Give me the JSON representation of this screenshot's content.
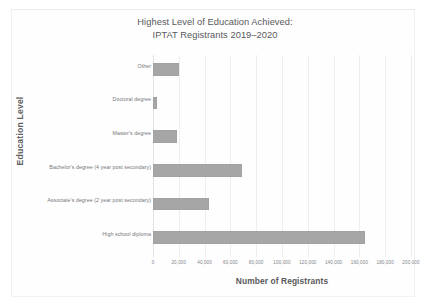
{
  "document": {
    "kind": "scanned-chart-page",
    "background_color": "#ffffff",
    "frame_color": "#f1f1f1"
  },
  "chart_data": {
    "type": "bar",
    "orientation": "horizontal",
    "title": "Highest Level of Education Achieved:\nIPTAT Registrants 2019–2020",
    "title_line1": "Highest Level of Education Achieved:",
    "title_line2": "IPTAT Registrants 2019–2020",
    "xlabel": "Number of Registrants",
    "ylabel": "Education Level",
    "categories": [
      "Other",
      "Doctoral degree",
      "Master's degree",
      "Bachelor's degree (4 year post secondary)",
      "Associate's degree (2 year post secondary)",
      "High school diploma"
    ],
    "values": [
      20400,
      3400,
      18400,
      68800,
      43600,
      164000
    ],
    "xlim": [
      0,
      200000
    ],
    "xticks": [
      0,
      20000,
      40000,
      60000,
      80000,
      100000,
      120000,
      140000,
      160000,
      180000,
      200000
    ],
    "xtick_labels": [
      "0",
      "20,000",
      "40,000",
      "60,000",
      "80,000",
      "100,000",
      "120,000",
      "140,000",
      "160,000",
      "180,000",
      "200,000"
    ],
    "grid": true,
    "grid_axis": "x",
    "grid_color": "#eeeeee",
    "legend": null,
    "bar_color": "#a6a6a6",
    "title_color": "#59595b",
    "text_color": "#76767a"
  }
}
